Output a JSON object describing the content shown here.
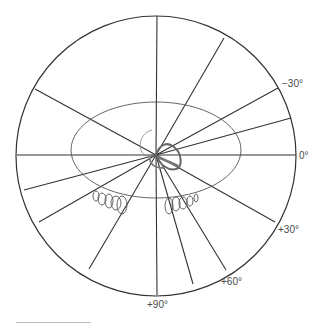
{
  "diagram": {
    "type": "polar-sky-projection",
    "center": [
      156,
      155
    ],
    "outer_circle": {
      "cx": 156,
      "cy": 156,
      "r": 140
    },
    "inner_ellipse": {
      "cx": 156,
      "cy": 150,
      "rx": 85,
      "ry": 48
    },
    "spokes": [
      {
        "x2": 157,
        "y2": 16
      },
      {
        "x2": 224,
        "y2": 38
      },
      {
        "x2": 278,
        "y2": 88
      },
      {
        "x2": 291,
        "y2": 118
      },
      {
        "x2": 296,
        "y2": 155
      },
      {
        "x2": 35,
        "y2": 89
      },
      {
        "x2": 17,
        "y2": 155
      },
      {
        "x2": 24,
        "y2": 190
      },
      {
        "x2": 39,
        "y2": 222
      },
      {
        "x2": 89,
        "y2": 269
      },
      {
        "x2": 157,
        "y2": 295
      },
      {
        "x2": 193,
        "y2": 284
      },
      {
        "x2": 226,
        "y2": 270
      },
      {
        "x2": 275,
        "y2": 222
      }
    ],
    "labels": [
      {
        "text": "−30°",
        "x": 282,
        "y": 87
      },
      {
        "text": "0°",
        "x": 299,
        "y": 159
      },
      {
        "text": "+30°",
        "x": 278,
        "y": 233
      },
      {
        "text": "+60°",
        "x": 221,
        "y": 285
      },
      {
        "text": "+90°",
        "x": 147,
        "y": 308
      }
    ],
    "left_loops": [
      {
        "cx": 96,
        "cy": 196,
        "rx": 3,
        "ry": 5
      },
      {
        "cx": 102,
        "cy": 199,
        "rx": 4,
        "ry": 6
      },
      {
        "cx": 109,
        "cy": 201,
        "rx": 4,
        "ry": 7
      },
      {
        "cx": 116,
        "cy": 203,
        "rx": 5,
        "ry": 7
      },
      {
        "cx": 122,
        "cy": 205,
        "rx": 5,
        "ry": 9
      }
    ],
    "right_loops": [
      {
        "cx": 169,
        "cy": 206,
        "rx": 4,
        "ry": 8
      },
      {
        "cx": 176,
        "cy": 204,
        "rx": 4,
        "ry": 7
      },
      {
        "cx": 183,
        "cy": 203,
        "rx": 4,
        "ry": 6
      },
      {
        "cx": 190,
        "cy": 201,
        "rx": 3,
        "ry": 5
      },
      {
        "cx": 196,
        "cy": 198,
        "rx": 2,
        "ry": 4
      }
    ],
    "colors": {
      "outer": "#333333",
      "spoke": "#333333",
      "ellipse": "#555555",
      "loop": "#555555",
      "label": "#4a4a4a"
    }
  }
}
